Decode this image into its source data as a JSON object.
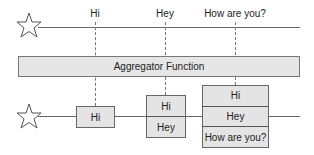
{
  "top_labels": [
    "Hi",
    "Hey",
    "How are you?"
  ],
  "aggregator": {
    "label": "Aggregator Function"
  },
  "output_windows": [
    {
      "items": [
        "Hi"
      ]
    },
    {
      "items": [
        "Hi",
        "Hey"
      ]
    },
    {
      "items": [
        "Hi",
        "Hey",
        "How are you?"
      ]
    }
  ],
  "icons": {
    "source_top": "star-icon",
    "source_bottom": "star-icon"
  },
  "colors": {
    "box_fill": "#e4e4e4",
    "line": "#666666"
  }
}
